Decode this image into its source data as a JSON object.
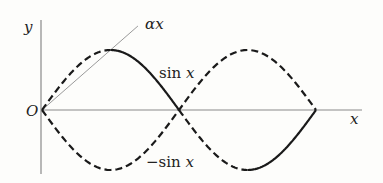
{
  "figure": {
    "labels": {
      "y_axis": "y",
      "x_axis": "x",
      "origin": "O",
      "line": "αx",
      "curve_pos": "sin x",
      "curve_neg": "−sin x"
    },
    "colors": {
      "axis": "#8a8a8a",
      "curve": "#1a1a1a",
      "line": "#9a9a9a",
      "text": "#222222"
    }
  },
  "chart_data": {
    "type": "line",
    "title": "",
    "xlabel": "x",
    "ylabel": "y",
    "xlim": [
      0,
      6.5
    ],
    "ylim": [
      -1.1,
      1.4
    ],
    "grid": false,
    "series": [
      {
        "name": "sin x",
        "function": "sin",
        "sign": 1,
        "domain": [
          0,
          6.2832
        ],
        "style": "dashed+solid",
        "solid_ranges": [
          [
            1.5708,
            3.1416
          ],
          [
            4.7124,
            6.2832
          ]
        ]
      },
      {
        "name": "-sin x",
        "function": "sin",
        "sign": -1,
        "domain": [
          0,
          6.2832
        ],
        "style": "dashed"
      },
      {
        "name": "αx",
        "function": "linear",
        "slope": 0.6366,
        "domain": [
          0,
          2.2
        ],
        "style": "solid-thin"
      }
    ],
    "annotations": [
      "O",
      "αx",
      "sin x",
      "−sin x"
    ]
  }
}
